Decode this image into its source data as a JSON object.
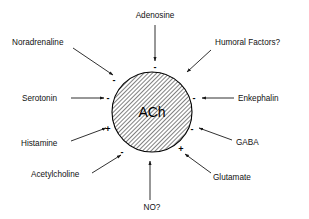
{
  "diagram": {
    "center": {
      "label": "ACh",
      "shape": "circle-hatched",
      "fill_color": "#cccccc",
      "stroke_color": "#000000"
    },
    "line_color": "#1a1a1a",
    "background_color": "#ffffff",
    "text_color": "#111111",
    "nodes": [
      {
        "id": "adenosine",
        "label": "Adenosine",
        "sign": "-",
        "position": "top",
        "text_x": 155,
        "text_y": 18,
        "anchor": "middle",
        "line_x1": 155,
        "line_y1": 25,
        "line_x2": 155,
        "line_y2": 61,
        "sign_x": 155,
        "sign_y": 70
      },
      {
        "id": "noradrenaline",
        "label": "Noradrenaline",
        "sign": "-",
        "position": "top-left",
        "text_x": 12,
        "text_y": 45,
        "anchor": "start",
        "line_x1": 73,
        "line_y1": 48,
        "line_x2": 113,
        "line_y2": 75,
        "sign_x": 114,
        "sign_y": 83
      },
      {
        "id": "humoral-factors",
        "label": "Humoral Factors?",
        "sign": null,
        "position": "top-right",
        "text_x": 215,
        "text_y": 45,
        "anchor": "start",
        "line_x1": 211,
        "line_y1": 50,
        "line_x2": 187,
        "line_y2": 72,
        "sign_x": null,
        "sign_y": null
      },
      {
        "id": "serotonin",
        "label": "Serotonin",
        "sign": "-",
        "position": "left",
        "text_x": 22,
        "text_y": 101,
        "anchor": "start",
        "line_x1": 71,
        "line_y1": 98,
        "line_x2": 104,
        "line_y2": 98,
        "sign_x": 108,
        "sign_y": 101
      },
      {
        "id": "enkephalin",
        "label": "Enkephalin",
        "sign": "-",
        "position": "right",
        "text_x": 238,
        "text_y": 101,
        "anchor": "start",
        "line_x1": 234,
        "line_y1": 98,
        "line_x2": 202,
        "line_y2": 98,
        "sign_x": 194,
        "sign_y": 101
      },
      {
        "id": "histamine",
        "label": "Histamine",
        "sign": "+",
        "position": "bottom-left",
        "text_x": 21,
        "text_y": 146,
        "anchor": "start",
        "line_x1": 71,
        "line_y1": 141,
        "line_x2": 106,
        "line_y2": 128,
        "sign_x": 108,
        "sign_y": 132
      },
      {
        "id": "gaba",
        "label": "GABA",
        "sign": "-",
        "position": "bottom-right",
        "text_x": 236,
        "text_y": 145,
        "anchor": "start",
        "line_x1": 232,
        "line_y1": 140,
        "line_x2": 199,
        "line_y2": 128,
        "sign_x": 192,
        "sign_y": 132
      },
      {
        "id": "acetylcholine",
        "label": "Acetylcholine",
        "sign": "-",
        "position": "bottom-left-lower",
        "text_x": 31,
        "text_y": 177,
        "anchor": "start",
        "line_x1": 92,
        "line_y1": 173,
        "line_x2": 121,
        "line_y2": 155,
        "sign_x": 122,
        "sign_y": 155
      },
      {
        "id": "glutamate",
        "label": "Glutamate",
        "sign": "+",
        "position": "bottom-right-lower",
        "text_x": 213,
        "text_y": 180,
        "anchor": "start",
        "line_x1": 211,
        "line_y1": 173,
        "line_x2": 185,
        "line_y2": 154,
        "sign_x": 181,
        "sign_y": 152
      },
      {
        "id": "no",
        "label": "NO?",
        "sign": null,
        "position": "bottom",
        "text_x": 152,
        "text_y": 210,
        "anchor": "middle",
        "line_x1": 150,
        "line_y1": 200,
        "line_x2": 150,
        "line_y2": 161,
        "sign_x": null,
        "sign_y": null
      }
    ]
  }
}
